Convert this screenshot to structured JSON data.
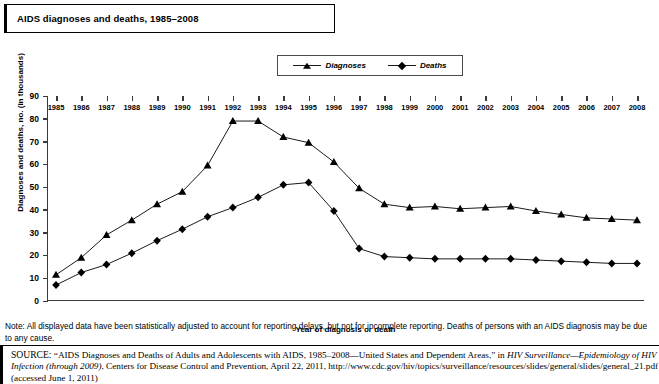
{
  "title": "AIDS diagnoses and deaths, 1985–2008",
  "legend": {
    "items": [
      {
        "label": "Diagnoses",
        "marker": "triangle-marker",
        "color": "#000000"
      },
      {
        "label": "Deaths",
        "marker": "diamond-marker",
        "color": "#000000"
      }
    ]
  },
  "note": "Note: All displayed data have been statistically adjusted to account for reporting delays, but not for incomplete reporting. Deaths of persons with an AIDS diagnosis may be due to any cause.",
  "source": {
    "prefix": "SOURCE:",
    "part1": "“AIDS Diagnoses and Deaths of Adults and Adolescents with AIDS, 1985–2008—United States and Dependent Areas,” in ",
    "italic1": "HIV Surveillance—Epidemiology of HIV Infection (through 2009)",
    "part2": ", Centers for Disease Control and Prevention, April 22, 2011, http://www.cdc.gov/hiv/topics/surveillance/resources/slides/general/slides/general_21.pdf (accessed June 1, 2011)"
  },
  "chart_data": {
    "type": "line",
    "title": "AIDS diagnoses and deaths, 1985–2008",
    "xlabel": "Year of diagnosis or death",
    "ylabel": "Diagnoses and deaths, no. (in thousands)",
    "ylim": [
      0,
      90
    ],
    "yticks": [
      0,
      10,
      20,
      30,
      40,
      50,
      60,
      70,
      80,
      90
    ],
    "grid": false,
    "legend_position": "top-center",
    "categories": [
      "1985",
      "1986",
      "1987",
      "1988",
      "1989",
      "1990",
      "1991",
      "1992",
      "1993",
      "1994",
      "1995",
      "1996",
      "1997",
      "1998",
      "1999",
      "2000",
      "2001",
      "2002",
      "2003",
      "2004",
      "2005",
      "2006",
      "2007",
      "2008"
    ],
    "series": [
      {
        "name": "Diagnoses",
        "marker": "triangle",
        "values": [
          11.5,
          19,
          29,
          35.5,
          42.5,
          48,
          59.5,
          79,
          79,
          72,
          69.5,
          61,
          49.5,
          42.5,
          41,
          41.5,
          40.5,
          41,
          41.5,
          39.5,
          38,
          36.5,
          36,
          35.5
        ]
      },
      {
        "name": "Deaths",
        "marker": "diamond",
        "values": [
          7,
          12.5,
          16,
          21,
          26.5,
          31.5,
          37,
          41,
          45.5,
          51,
          52,
          39.5,
          23,
          19.5,
          19,
          18.5,
          18.5,
          18.5,
          18.5,
          18,
          17.5,
          17,
          16.5,
          16.5
        ]
      }
    ]
  }
}
